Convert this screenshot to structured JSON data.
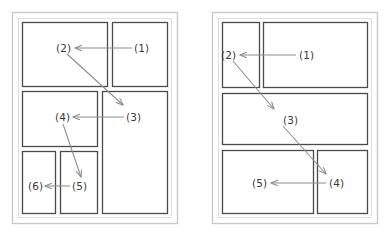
{
  "figure": {
    "type": "two-panel-schematic-diagram",
    "background_color": "#ffffff",
    "outer_frame_color": "#c9c9c9",
    "box_border_color": "#4a4a4a",
    "leader_line_color": "#8c8c8c",
    "label_text_color": "#3b3b3b"
  },
  "panels": [
    {
      "id": "left-panel",
      "name": "left-layout-panel",
      "frame": {
        "x": 12,
        "y": 12,
        "w": 166,
        "h": 212
      },
      "inner": {
        "x": 18,
        "y": 18,
        "w": 154,
        "h": 200
      },
      "regions": [
        {
          "id": "L-top-left",
          "x": 22,
          "y": 22,
          "w": 86,
          "h": 65
        },
        {
          "id": "L-top-right",
          "x": 112,
          "y": 22,
          "w": 56,
          "h": 65
        },
        {
          "id": "L-mid-left",
          "x": 22,
          "y": 91,
          "w": 76,
          "h": 56
        },
        {
          "id": "L-right-tall",
          "x": 102,
          "y": 91,
          "w": 66,
          "h": 123
        },
        {
          "id": "L-bot-left",
          "x": 22,
          "y": 151,
          "w": 34,
          "h": 63
        },
        {
          "id": "L-bot-mid",
          "x": 60,
          "y": 151,
          "w": 38,
          "h": 63
        }
      ],
      "labels": [
        {
          "id": "L1",
          "text": "(1)",
          "x": 136,
          "y": 48
        },
        {
          "id": "L2",
          "text": "(2)",
          "x": 58,
          "y": 48
        },
        {
          "id": "L3",
          "text": "(3)",
          "x": 127,
          "y": 117
        },
        {
          "id": "L4",
          "text": "(4)",
          "x": 56,
          "y": 117
        },
        {
          "id": "L5",
          "text": "(5)",
          "x": 74,
          "y": 186
        },
        {
          "id": "L6",
          "text": "(6)",
          "x": 29,
          "y": 186
        }
      ],
      "leaders": [
        {
          "id": "L1-to-L2",
          "kind": "arrow-horizontal",
          "from": [
            132,
            48
          ],
          "to": [
            74,
            48
          ]
        },
        {
          "id": "L2-to-L3",
          "kind": "arrow-diagonal",
          "from": [
            68,
            54
          ],
          "to": [
            124,
            106
          ]
        },
        {
          "id": "L3-to-L4",
          "kind": "arrow-horizontal",
          "from": [
            124,
            117
          ],
          "to": [
            72,
            117
          ]
        },
        {
          "id": "L4-to-L5",
          "kind": "arrow-diagonal",
          "from": [
            64,
            124
          ],
          "to": [
            82,
            178
          ]
        },
        {
          "id": "L5-to-L6",
          "kind": "arrow-horizontal",
          "from": [
            70,
            186
          ],
          "to": [
            44,
            186
          ]
        }
      ]
    },
    {
      "id": "right-panel",
      "name": "right-layout-panel",
      "frame": {
        "x": 212,
        "y": 12,
        "w": 166,
        "h": 212
      },
      "inner": {
        "x": 218,
        "y": 18,
        "w": 154,
        "h": 200
      },
      "regions": [
        {
          "id": "R-top-left",
          "x": 222,
          "y": 22,
          "w": 38,
          "h": 66
        },
        {
          "id": "R-top-right",
          "x": 263,
          "y": 22,
          "w": 105,
          "h": 66
        },
        {
          "id": "R-mid-wide",
          "x": 222,
          "y": 93,
          "w": 146,
          "h": 52
        },
        {
          "id": "R-bot-left",
          "x": 222,
          "y": 150,
          "w": 92,
          "h": 64
        },
        {
          "id": "R-bot-right",
          "x": 317,
          "y": 150,
          "w": 51,
          "h": 64
        }
      ],
      "labels": [
        {
          "id": "R1",
          "text": "(1)",
          "x": 300,
          "y": 55
        },
        {
          "id": "R2",
          "text": "(2)",
          "x": 223,
          "y": 55
        },
        {
          "id": "R3",
          "text": "(3)",
          "x": 285,
          "y": 120
        },
        {
          "id": "R4",
          "text": "(4)",
          "x": 330,
          "y": 183
        },
        {
          "id": "R5",
          "text": "(5)",
          "x": 254,
          "y": 183
        }
      ],
      "leaders": [
        {
          "id": "R1-to-R2",
          "kind": "arrow-horizontal",
          "from": [
            296,
            55
          ],
          "to": [
            239,
            55
          ]
        },
        {
          "id": "R2-to-R3",
          "kind": "arrow-diagonal",
          "from": [
            234,
            61
          ],
          "to": [
            275,
            110
          ]
        },
        {
          "id": "R3-to-R4",
          "kind": "arrow-diagonal",
          "from": [
            284,
            126
          ],
          "to": [
            327,
            175
          ]
        },
        {
          "id": "R4-to-R5",
          "kind": "arrow-horizontal",
          "from": [
            326,
            183
          ],
          "to": [
            270,
            183
          ]
        }
      ]
    }
  ]
}
